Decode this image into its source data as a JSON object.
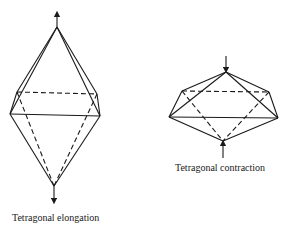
{
  "figures": [
    {
      "id": "elongation",
      "caption": "Tetragonal elongation",
      "arrows": "outward along z axis"
    },
    {
      "id": "contraction",
      "caption": "Tetragonal contraction",
      "arrows": "inward along z axis"
    }
  ],
  "colors": {
    "line": "#1a1a1a",
    "background": "#ffffff"
  }
}
